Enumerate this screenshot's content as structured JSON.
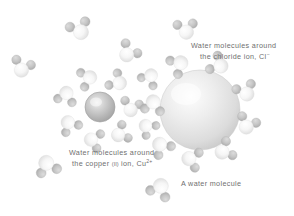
{
  "figure": {
    "type": "illustration",
    "background_color": "#ffffff",
    "text_color": "#6f6f6f"
  },
  "labels": {
    "chloride": {
      "line1": "Water molecules around",
      "line2_pre": "the chloride ion,",
      "species": "Cl",
      "charge": "−"
    },
    "copper": {
      "line1": "Water molecules around",
      "line2_pre": "the copper",
      "roman": "(II)",
      "line2_post": "ion,",
      "species": "Cu",
      "charge": "2+"
    },
    "water": {
      "text": "A water molecule"
    }
  },
  "species": {
    "chloride_ion": {
      "name": "chloride-ion-sphere",
      "color_light": "#f2f2f2",
      "color_mid": "#d8d8d8",
      "color_edge": "#bdbdbd",
      "radius": 40,
      "cx": 200,
      "cy": 110
    },
    "copper_ion": {
      "name": "copper-ion-sphere",
      "color_light": "#e6e6e6",
      "color_mid": "#bdbdbd",
      "color_edge": "#9a9a9a",
      "radius": 15,
      "cx": 100,
      "cy": 107
    },
    "water_molecule": {
      "oxygen_color": "#fbfbfb",
      "oxygen_edge": "#d5d5d5",
      "hydrogen_color": "#c9c9c9",
      "hydrogen_edge": "#a8a8a8",
      "oxygen_radius": 7,
      "hydrogen_radius": 4.6
    }
  },
  "water_molecules": [
    {
      "id": "w-free-left",
      "x": 22,
      "y": 68,
      "rot": 15,
      "scale": 1.0
    },
    {
      "id": "w-top-left",
      "x": 80,
      "y": 30,
      "rot": -25,
      "scale": 1.05
    },
    {
      "id": "w-top-mid",
      "x": 128,
      "y": 53,
      "rot": 35,
      "scale": 1.0
    },
    {
      "id": "w-top-right",
      "x": 186,
      "y": 30,
      "rot": -10,
      "scale": 1.0
    },
    {
      "id": "w-left-mid",
      "x": 47,
      "y": 165,
      "rot": 160,
      "scale": 1.05
    },
    {
      "id": "w-bottom-free",
      "x": 160,
      "y": 188,
      "rot": 200,
      "scale": 1.05
    },
    {
      "id": "w-cu-shell-1",
      "x": 88,
      "y": 78,
      "rot": 250,
      "scale": 0.95
    },
    {
      "id": "w-cu-shell-2",
      "x": 118,
      "y": 82,
      "rot": 300,
      "scale": 0.95
    },
    {
      "id": "w-cu-shell-3",
      "x": 131,
      "y": 108,
      "rot": 10,
      "scale": 0.95
    },
    {
      "id": "w-cu-shell-4",
      "x": 120,
      "y": 134,
      "rot": 60,
      "scale": 0.95
    },
    {
      "id": "w-cu-shell-5",
      "x": 93,
      "y": 140,
      "rot": 100,
      "scale": 0.95
    },
    {
      "id": "w-cu-shell-6",
      "x": 69,
      "y": 124,
      "rot": 145,
      "scale": 0.95
    },
    {
      "id": "w-cu-shell-7",
      "x": 66,
      "y": 95,
      "rot": 190,
      "scale": 0.95
    },
    {
      "id": "w-cl-shell-1",
      "x": 179,
      "y": 64,
      "rot": 235,
      "scale": 1.0
    },
    {
      "id": "w-cl-shell-2",
      "x": 219,
      "y": 65,
      "rot": 295,
      "scale": 1.0
    },
    {
      "id": "w-cl-shell-3",
      "x": 246,
      "y": 92,
      "rot": 335,
      "scale": 1.0
    },
    {
      "id": "w-cl-shell-4",
      "x": 247,
      "y": 125,
      "rot": 20,
      "scale": 1.0
    },
    {
      "id": "w-cl-shell-5",
      "x": 224,
      "y": 151,
      "rot": 60,
      "scale": 1.0
    },
    {
      "id": "w-cl-shell-6",
      "x": 191,
      "y": 159,
      "rot": 100,
      "scale": 1.0
    },
    {
      "id": "w-cl-shell-7",
      "x": 161,
      "y": 146,
      "rot": 140,
      "scale": 1.0
    },
    {
      "id": "w-cl-shell-8",
      "x": 153,
      "y": 104,
      "rot": 185,
      "scale": 1.0
    },
    {
      "id": "w-mid-1",
      "x": 150,
      "y": 77,
      "rot": 210,
      "scale": 0.92
    },
    {
      "id": "w-mid-2",
      "x": 147,
      "y": 127,
      "rot": 130,
      "scale": 0.9
    }
  ]
}
